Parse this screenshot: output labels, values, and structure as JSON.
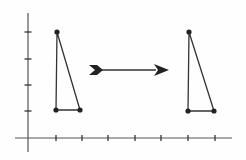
{
  "diagram": {
    "type": "translation-of-triangle",
    "colors": {
      "background": "#fefefe",
      "stroke": "#333333",
      "axis": "#555555"
    },
    "axes": {
      "x_axis": {
        "y": 138,
        "x_start": 15,
        "x_end": 232,
        "ticks_x": [
          56,
          82,
          108,
          135,
          161,
          188,
          215
        ]
      },
      "y_axis": {
        "x": 28,
        "y_start": 13,
        "y_end": 152,
        "ticks_y": [
          32,
          59,
          85,
          111
        ]
      }
    },
    "original_triangle": {
      "label": "pre-image",
      "vertices": [
        [
          57,
          32
        ],
        [
          56,
          110
        ],
        [
          80,
          110
        ]
      ],
      "grid_vertices": [
        [
          1,
          4
        ],
        [
          1,
          1
        ],
        [
          2,
          1
        ]
      ]
    },
    "translated_triangle": {
      "label": "image",
      "vertices": [
        [
          189,
          32
        ],
        [
          188,
          111
        ],
        [
          214,
          111
        ]
      ],
      "grid_vertices": [
        [
          6,
          4
        ],
        [
          6,
          1
        ],
        [
          7,
          1
        ]
      ]
    },
    "arrow": {
      "label": "translation-arrow",
      "direction": "right",
      "x_start": 89,
      "x_end": 169,
      "y": 70
    }
  }
}
